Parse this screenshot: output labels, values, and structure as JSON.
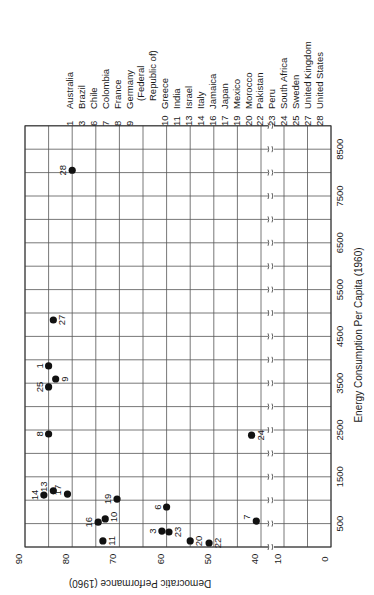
{
  "chart_data": {
    "type": "scatter",
    "orientation": "rotated 90 degrees clockwise on page",
    "title": "",
    "xlabel": "Energy Consumption Per Capita (1960)",
    "ylabel": "Democratic Performance (1960)",
    "xlim": [
      0,
      9000
    ],
    "ylim": [
      0,
      90
    ],
    "x_ticks": [
      "500",
      "1500",
      "2500",
      "3500",
      "4500",
      "5500",
      "6500",
      "7500",
      "8500"
    ],
    "y_ticks": [
      "0",
      "10",
      "40",
      "50",
      "60",
      "70",
      "80",
      "90"
    ],
    "y_axis_break": "between 10 and 40",
    "grid": true,
    "legend_position": "right of plot (top of page)",
    "points": [
      {
        "id": "1",
        "country": "Australia",
        "x": 3870,
        "y": 85
      },
      {
        "id": "3",
        "country": "Brazil",
        "x": 340,
        "y": 61
      },
      {
        "id": "6",
        "country": "Chile",
        "x": 855,
        "y": 60
      },
      {
        "id": "7",
        "country": "Colombia",
        "x": 555,
        "y": 41
      },
      {
        "id": "8",
        "country": "France",
        "x": 2415,
        "y": 85
      },
      {
        "id": "9",
        "country": "Germany (Federal Republic of)",
        "x": 3590,
        "y": 83.5
      },
      {
        "id": "10",
        "country": "Greece",
        "x": 600,
        "y": 73
      },
      {
        "id": "11",
        "country": "India",
        "x": 130,
        "y": 73.5
      },
      {
        "id": "13",
        "country": "Israel",
        "x": 1200,
        "y": 84
      },
      {
        "id": "14",
        "country": "Italy",
        "x": 1110,
        "y": 86
      },
      {
        "id": "16",
        "country": "Jamaica",
        "x": 530,
        "y": 74.5
      },
      {
        "id": "17",
        "country": "Japan",
        "x": 1130,
        "y": 81
      },
      {
        "id": "19",
        "country": "Mexico",
        "x": 1025,
        "y": 70.5
      },
      {
        "id": "20",
        "country": "Morocco",
        "x": 130,
        "y": 55
      },
      {
        "id": "22",
        "country": "Pakistan",
        "x": 85,
        "y": 51
      },
      {
        "id": "23",
        "country": "Peru",
        "x": 320,
        "y": 59.5
      },
      {
        "id": "24",
        "country": "South Africa",
        "x": 2390,
        "y": 42
      },
      {
        "id": "25",
        "country": "Sweden",
        "x": 3420,
        "y": 85
      },
      {
        "id": "27",
        "country": "United Kingdom",
        "x": 4850,
        "y": 84
      },
      {
        "id": "28",
        "country": "United States",
        "x": 8050,
        "y": 80
      }
    ]
  },
  "legend": [
    {
      "num": "1",
      "name": "Australia"
    },
    {
      "num": "3",
      "name": "Brazil"
    },
    {
      "num": "6",
      "name": "Chile"
    },
    {
      "num": "7",
      "name": "Colombia"
    },
    {
      "num": "8",
      "name": "France"
    },
    {
      "num": "9",
      "name": "Germany"
    },
    {
      "num": "",
      "name": "(Federal"
    },
    {
      "num": "",
      "name": "Republic of)"
    },
    {
      "num": "10",
      "name": "Greece"
    },
    {
      "num": "11",
      "name": "India"
    },
    {
      "num": "13",
      "name": "Israel"
    },
    {
      "num": "14",
      "name": "Italy"
    },
    {
      "num": "16",
      "name": "Jamaica"
    },
    {
      "num": "17",
      "name": "Japan"
    },
    {
      "num": "19",
      "name": "Mexico"
    },
    {
      "num": "20",
      "name": "Morocco"
    },
    {
      "num": "22",
      "name": "Pakistan"
    },
    {
      "num": "23",
      "name": "Peru"
    },
    {
      "num": "24",
      "name": "South Africa"
    },
    {
      "num": "25",
      "name": "Sweden"
    },
    {
      "num": "27",
      "name": "United Kingdom"
    },
    {
      "num": "28",
      "name": "United States"
    }
  ],
  "label_offsets": {
    "1": [
      -9,
      0
    ],
    "3": [
      -9,
      0
    ],
    "6": [
      -9,
      0
    ],
    "7": [
      -9,
      -4
    ],
    "8": [
      -9,
      0
    ],
    "9": [
      9,
      0
    ],
    "10": [
      9,
      -2
    ],
    "11": [
      9,
      0
    ],
    "13": [
      -9,
      -4
    ],
    "14": [
      -9,
      0
    ],
    "16": [
      -9,
      0
    ],
    "17": [
      -9,
      -4
    ],
    "19": [
      -9,
      0
    ],
    "20": [
      9,
      0
    ],
    "22": [
      9,
      0
    ],
    "23": [
      9,
      0
    ],
    "24": [
      9,
      0
    ],
    "25": [
      -9,
      0
    ],
    "27": [
      9,
      0
    ],
    "28": [
      -9,
      0
    ]
  }
}
